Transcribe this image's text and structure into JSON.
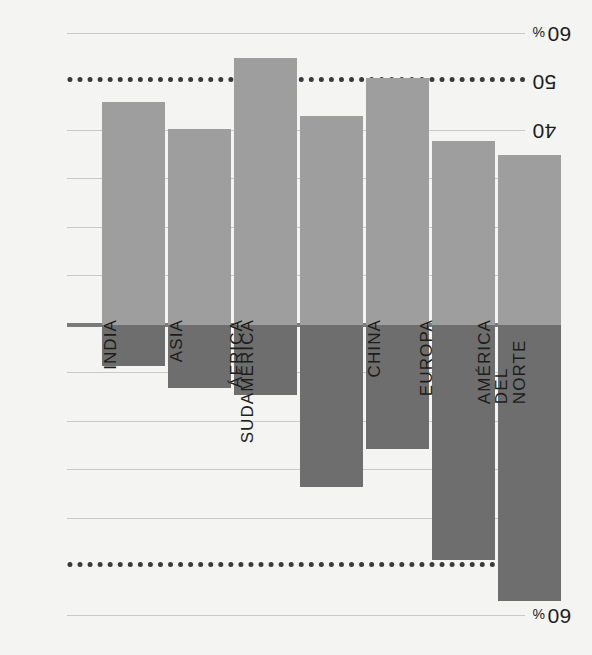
{
  "chart_data": {
    "type": "bar",
    "title": "",
    "subtitle": "",
    "xlabel": "",
    "ylabel": "",
    "orientation": "vertical-diverging",
    "rotated_180": true,
    "grid": true,
    "legend": "none",
    "axis_unit": "%",
    "ylim": [
      -60,
      60
    ],
    "yticks": [
      -60,
      -50,
      -40,
      -30,
      -20,
      -10,
      0,
      10,
      20,
      30,
      40,
      50,
      60
    ],
    "ytick_labels": [
      "60 %",
      "50",
      "40",
      "30",
      "20",
      "10",
      "0",
      "10",
      "20",
      "30",
      "40",
      "50",
      "60 %"
    ],
    "highlight_gridlines": [
      50,
      -50
    ],
    "categories": [
      "AMÉRICA\nDEL NORTE",
      "EUROPA",
      "CHINA",
      "SUDAMÉRICA",
      "ÁFRICA",
      "ASIA",
      "INDIA"
    ],
    "series": [
      {
        "name": "positive",
        "color": "#6e6e6e",
        "values": [
          57,
          48.5,
          25.5,
          33.5,
          14.5,
          13,
          8.5
        ]
      },
      {
        "name": "negative",
        "color": "#9e9e9e",
        "values": [
          -35,
          -38,
          -51,
          -43,
          -55,
          -40.5,
          -46
        ]
      }
    ]
  },
  "colors": {
    "background": "#f4f4f2",
    "bar_positive": "#6e6e6e",
    "bar_negative": "#9e9e9e",
    "gridline": "#c9c9c7",
    "zero_axis": "#7a7a7a",
    "dotted_line": "#3a3a3a",
    "text": "#1d1d1b"
  }
}
